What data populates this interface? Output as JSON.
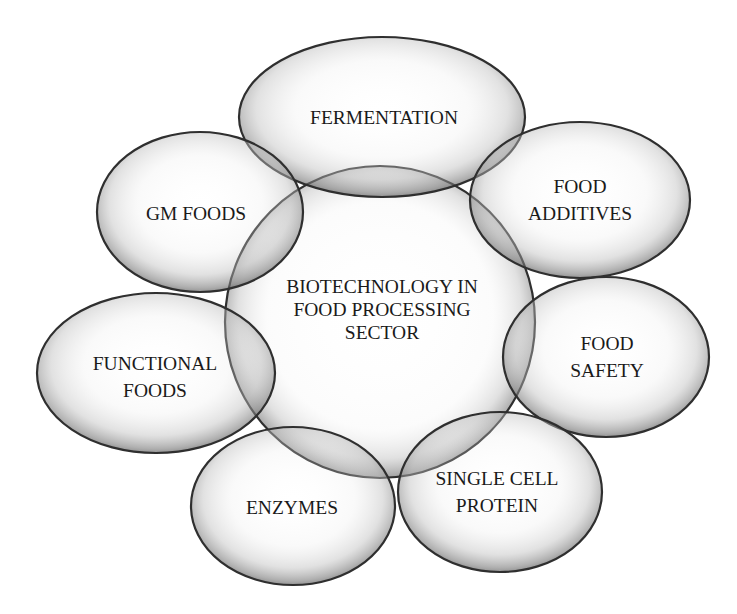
{
  "diagram": {
    "type": "overlapping-bubble-cluster",
    "background": "#ffffff",
    "outline_color": "#2f2f2f",
    "text_color": "#1a1a1a",
    "center": {
      "lines": [
        "BIOTECHNOLOGY IN",
        "FOOD PROCESSING",
        "SECTOR"
      ],
      "shape": {
        "cx": 380,
        "cy": 322,
        "rx": 155,
        "ry": 156
      },
      "label_pos": {
        "x": 382,
        "y": 309
      }
    },
    "nodes": [
      {
        "id": "fermentation",
        "lines": [
          "FERMENTATION"
        ],
        "shape": {
          "cx": 382,
          "cy": 117,
          "rx": 143,
          "ry": 80
        },
        "label_pos": {
          "x": 384,
          "y": 117
        }
      },
      {
        "id": "food-additives",
        "lines": [
          "FOOD",
          "ADDITIVES"
        ],
        "shape": {
          "cx": 580,
          "cy": 200,
          "rx": 110,
          "ry": 78
        },
        "label_pos": {
          "x": 580,
          "y": 200
        }
      },
      {
        "id": "food-safety",
        "lines": [
          "FOOD",
          "SAFETY"
        ],
        "shape": {
          "cx": 606,
          "cy": 357,
          "rx": 103,
          "ry": 80
        },
        "label_pos": {
          "x": 607,
          "y": 357
        }
      },
      {
        "id": "single-cell-protein",
        "lines": [
          "SINGLE CELL",
          "PROTEIN"
        ],
        "shape": {
          "cx": 500,
          "cy": 492,
          "rx": 102,
          "ry": 80
        },
        "label_pos": {
          "x": 497,
          "y": 492
        }
      },
      {
        "id": "enzymes",
        "lines": [
          "ENZYMES"
        ],
        "shape": {
          "cx": 293,
          "cy": 506,
          "rx": 102,
          "ry": 79
        },
        "label_pos": {
          "x": 292,
          "y": 507
        }
      },
      {
        "id": "functional-foods",
        "lines": [
          "FUNCTIONAL",
          "FOODS"
        ],
        "shape": {
          "cx": 156,
          "cy": 373,
          "rx": 119,
          "ry": 80
        },
        "label_pos": {
          "x": 155,
          "y": 377
        }
      },
      {
        "id": "gm-foods",
        "lines": [
          "GM FOODS"
        ],
        "shape": {
          "cx": 200,
          "cy": 212,
          "rx": 103,
          "ry": 80
        },
        "label_pos": {
          "x": 196,
          "y": 213
        }
      }
    ]
  }
}
